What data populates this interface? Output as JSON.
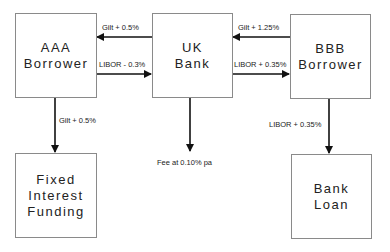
{
  "nodes": {
    "aaa_borrower": {
      "lines": [
        "AAA",
        "Borrower"
      ]
    },
    "uk_bank": {
      "lines": [
        "UK",
        "Bank"
      ]
    },
    "bbb_borrower": {
      "lines": [
        "BBB",
        "Borrower"
      ]
    },
    "fixed_interest_funding": {
      "lines": [
        "Fixed",
        "Interest",
        "Funding"
      ]
    },
    "bank_loan": {
      "lines": [
        "Bank",
        "Loan"
      ]
    }
  },
  "edges": {
    "bank_to_aaa": {
      "label": "Gilt + 0.5%"
    },
    "aaa_to_bank": {
      "label": "LIBOR - 0.3%"
    },
    "bbb_to_bank": {
      "label": "Gilt + 1.25%"
    },
    "bank_to_bbb": {
      "label": "LIBOR + 0.35%"
    },
    "aaa_to_fixed": {
      "label": "Gilt + 0.5%"
    },
    "bank_fee": {
      "label": "Fee at 0.10% pa"
    },
    "bbb_to_loan": {
      "label": "LIBOR + 0.35%"
    }
  },
  "colors": {
    "line": "#111111",
    "box_border": "#8a8a8a"
  }
}
